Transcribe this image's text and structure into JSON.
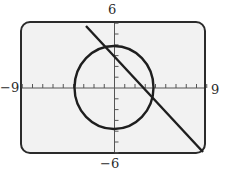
{
  "chart_data": {
    "type": "line",
    "title": "",
    "xlabel": "",
    "ylabel": "",
    "xlim": [
      -9,
      9
    ],
    "ylim": [
      -6,
      6
    ],
    "grid": false,
    "x_ticks_step": 1,
    "y_ticks_step": 1,
    "window_labels": {
      "ymax": "6",
      "ymin": "−6",
      "xmin": "−9",
      "xmax": "9"
    },
    "series": [
      {
        "name": "circle",
        "equation": "x^2 + y^2 = 16",
        "center": [
          0,
          0
        ],
        "radius": 4
      },
      {
        "name": "line",
        "equation": "y = -x + 3",
        "slope": -1,
        "intercept": 3,
        "endpoints": [
          [
            -2.7,
            5.6
          ],
          [
            8.6,
            -6
          ]
        ]
      }
    ],
    "intersections": [
      [
        -0.9,
        3.9
      ],
      [
        3.9,
        -0.9
      ]
    ]
  },
  "colors": {
    "screen_bg": "#f2f2f2",
    "frame": "#2b2b2b",
    "curve": "#1e1e1e",
    "axis": "#555555",
    "page_bg": "#ffffff"
  }
}
